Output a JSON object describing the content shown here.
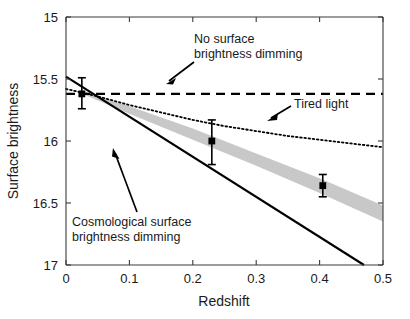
{
  "chart_data": {
    "type": "line",
    "title": "",
    "xlabel": "Redshift",
    "ylabel": "Surface brightness",
    "xlim": [
      0,
      0.5
    ],
    "ylim": [
      17,
      15
    ],
    "y_inverted": true,
    "grid": false,
    "legend_position": "none",
    "xticks": [
      "0",
      "0.1",
      "0.2",
      "0.3",
      "0.4",
      "0.5"
    ],
    "xtick_values": [
      0,
      0.1,
      0.2,
      0.3,
      0.4,
      0.5
    ],
    "yticks": [
      "15",
      "15.5",
      "16",
      "16.5",
      "17"
    ],
    "ytick_values": [
      15,
      15.5,
      16,
      16.5,
      17
    ],
    "series": [
      {
        "name": "No surface brightness dimming",
        "style": "dashed",
        "color": "#000000",
        "x": [
          0.0,
          0.5
        ],
        "values": [
          15.62,
          15.62
        ]
      },
      {
        "name": "Tired light",
        "style": "dotted",
        "color": "#000000",
        "x": [
          0.0,
          0.05,
          0.1,
          0.15,
          0.2,
          0.25,
          0.3,
          0.35,
          0.4,
          0.45,
          0.5
        ],
        "values": [
          15.58,
          15.64,
          15.71,
          15.77,
          15.83,
          15.88,
          15.92,
          15.96,
          15.99,
          16.02,
          16.05
        ]
      },
      {
        "name": "Cosmological surface brightness dimming",
        "style": "solid",
        "color": "#000000",
        "x": [
          0.0,
          0.47
        ],
        "values": [
          15.48,
          17.0
        ]
      },
      {
        "name": "Model band",
        "style": "band",
        "color": "#c8c8c8",
        "x": [
          0.03,
          0.1,
          0.2,
          0.3,
          0.4,
          0.5
        ],
        "upper": [
          15.6,
          15.72,
          15.9,
          16.1,
          16.3,
          16.52
        ],
        "lower": [
          15.63,
          15.78,
          15.99,
          16.2,
          16.42,
          16.65
        ]
      }
    ],
    "data_points": [
      {
        "x": 0.025,
        "y": 15.62,
        "yerr_low": 15.49,
        "yerr_high": 15.74
      },
      {
        "x": 0.23,
        "y": 16.0,
        "yerr_low": 15.83,
        "yerr_high": 16.19
      },
      {
        "x": 0.405,
        "y": 16.36,
        "yerr_low": 16.27,
        "yerr_high": 16.45
      }
    ],
    "annotations": [
      {
        "name": "no-dimming-label",
        "line1": "No surface",
        "line2": "brightness dimming",
        "arrow": "down-left"
      },
      {
        "name": "tired-light-label",
        "line1": "Tired light",
        "line2": "",
        "arrow": "down-left"
      },
      {
        "name": "cosmological-dimming-label",
        "line1": "Cosmological surface",
        "line2": "brightness dimming",
        "arrow": "up-right"
      }
    ],
    "colors": {
      "axis": "#3a3a3a",
      "line": "#000000",
      "band": "#c8c8c8",
      "marker": "#000000",
      "background": "#ffffff"
    }
  }
}
